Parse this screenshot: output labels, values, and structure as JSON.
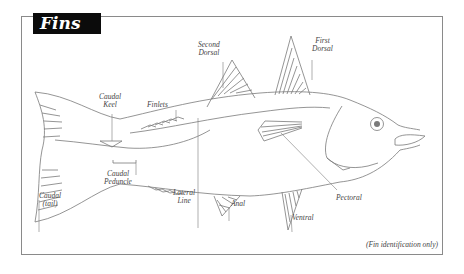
{
  "title": "Fins",
  "footnote": "(Fin identification only)",
  "labels": {
    "second_dorsal": [
      "Second",
      "Dorsal"
    ],
    "first_dorsal": [
      "First",
      "Dorsal"
    ],
    "finlets": [
      "Finlets"
    ],
    "caudal_keel": [
      "Caudal",
      "Keel"
    ],
    "caudal_peduncle": [
      "Caudal",
      "Peduncle"
    ],
    "caudal_tail": [
      "Caudal",
      "(tail)"
    ],
    "lateral_line": [
      "Lateral",
      "Line"
    ],
    "anal": [
      "Anal"
    ],
    "ventral": [
      "Ventral"
    ],
    "pectoral": [
      "Pectoral"
    ]
  },
  "colors": {
    "line": "#7a7a7a",
    "title_bg": "#0b0b0b",
    "title_text": "#ffffff",
    "label_text": "#444444",
    "frame": "#8a8a8a"
  }
}
